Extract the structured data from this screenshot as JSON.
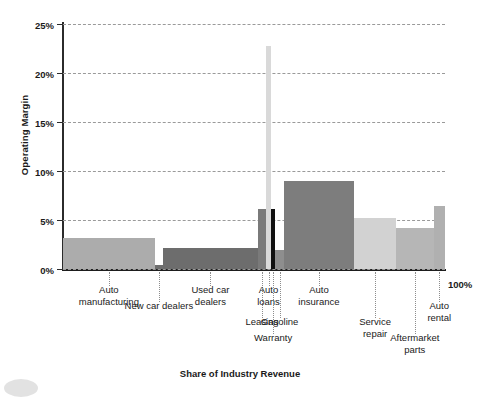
{
  "chart_data": {
    "type": "bar",
    "title": "",
    "xlabel": "Share of Industry Revenue",
    "ylabel": "Operating Margin",
    "ylim": [
      0,
      25
    ],
    "yticks": [
      "0%",
      "5%",
      "10%",
      "15%",
      "20%",
      "25%"
    ],
    "ytick_values": [
      0,
      5,
      10,
      15,
      20,
      25
    ],
    "grid": true,
    "legend": false,
    "x_axis_end_label": "100%",
    "note": "Marimekko / variable-width bar chart: bar width = share of industry revenue, bar height = operating margin",
    "categories": [
      "Auto manufacturing",
      "New car dealers",
      "Used car dealers",
      "Leasing",
      "Auto loans",
      "Warranty",
      "Gasoline",
      "Auto insurance",
      "Service repair",
      "Aftermarket parts",
      "Auto rental"
    ],
    "values": [
      3.2,
      0.4,
      2.1,
      6.1,
      22.8,
      6.1,
      1.9,
      9.0,
      5.2,
      4.2,
      6.4
    ],
    "widths_pct": [
      24.1,
      2.1,
      24.9,
      2.1,
      1.3,
      1.0,
      2.4,
      18.3,
      11.0,
      9.9,
      2.9
    ],
    "colors": [
      "#acacac",
      "#6e6e6e",
      "#6d6d6d",
      "#7a7a7a",
      "#d9d9d9",
      "#111111",
      "#8e8e8e",
      "#7d7d7d",
      "#d2d2d2",
      "#b6b6b6",
      "#b0b0b0"
    ]
  },
  "bars": [
    {
      "name": "auto-manufacturing",
      "label": "Auto\nmanufacturing",
      "value": 3.2,
      "x0": 0.0,
      "x1": 24.1,
      "color": "#acacac"
    },
    {
      "name": "new-car-dealers",
      "label": "New car dealers",
      "value": 0.4,
      "x0": 24.1,
      "x1": 26.2,
      "color": "#6e6e6e"
    },
    {
      "name": "used-car-dealers",
      "label": "Used car\ndealers",
      "value": 2.1,
      "x0": 26.2,
      "x1": 51.1,
      "color": "#6d6d6d"
    },
    {
      "name": "leasing",
      "label": "Leasing",
      "value": 6.1,
      "x0": 51.1,
      "x1": 53.2,
      "color": "#7a7a7a"
    },
    {
      "name": "auto-loans",
      "label": "Auto\nloans",
      "value": 22.8,
      "x0": 53.2,
      "x1": 54.5,
      "color": "#d9d9d9"
    },
    {
      "name": "warranty",
      "label": "Warranty",
      "value": 6.1,
      "x0": 54.5,
      "x1": 55.5,
      "color": "#111111"
    },
    {
      "name": "gasoline",
      "label": "Gasoline",
      "value": 1.9,
      "x0": 55.5,
      "x1": 57.9,
      "color": "#8e8e8e"
    },
    {
      "name": "auto-insurance",
      "label": "Auto\ninsurance",
      "value": 9.0,
      "x0": 57.9,
      "x1": 76.2,
      "color": "#7d7d7d"
    },
    {
      "name": "service-repair",
      "label": "Service\nrepair",
      "value": 5.2,
      "x0": 76.2,
      "x1": 87.2,
      "color": "#d2d2d2"
    },
    {
      "name": "aftermarket-parts",
      "label": "Aftermarket\nparts",
      "value": 4.2,
      "x0": 87.2,
      "x1": 97.1,
      "color": "#b6b6b6"
    },
    {
      "name": "auto-rental",
      "label": "Auto\nrental",
      "value": 6.4,
      "x0": 97.1,
      "x1": 100.0,
      "color": "#b0b0b0"
    }
  ],
  "labels": [
    {
      "name": "label-auto-manufacturing",
      "text": "Auto\nmanufacturing",
      "cx": 12.0,
      "row": 0
    },
    {
      "name": "label-new-car-dealers",
      "text": "New car dealers",
      "cx": 25.1,
      "row": 1
    },
    {
      "name": "label-used-car-dealers",
      "text": "Used car\ndealers",
      "cx": 38.6,
      "row": 0
    },
    {
      "name": "label-leasing",
      "text": "Leasing",
      "cx": 52.1,
      "row": 2
    },
    {
      "name": "label-auto-loans",
      "text": "Auto\nloans",
      "cx": 53.8,
      "row": 0
    },
    {
      "name": "label-warranty",
      "text": "Warranty",
      "cx": 55.0,
      "row": 3
    },
    {
      "name": "label-gasoline",
      "text": "Gasoline",
      "cx": 56.7,
      "row": 2
    },
    {
      "name": "label-auto-insurance",
      "text": "Auto\ninsurance",
      "cx": 67.0,
      "row": 0
    },
    {
      "name": "label-service-repair",
      "text": "Service\nrepair",
      "cx": 81.7,
      "row": 2
    },
    {
      "name": "label-aftermarket-parts",
      "text": "Aftermarket\nparts",
      "cx": 92.1,
      "row": 3
    },
    {
      "name": "label-auto-rental",
      "text": "Auto\nrental",
      "cx": 98.5,
      "row": 1
    }
  ],
  "axes": {
    "y_title": "Operating Margin",
    "x_title": "Share of Industry Revenue",
    "x_end": "100%"
  }
}
